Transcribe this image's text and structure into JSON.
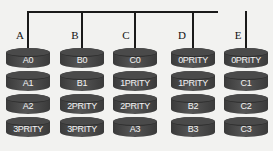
{
  "diagram": {
    "title": "",
    "bus": {
      "color": "#1a1a1a"
    },
    "disk_color": "#474747",
    "text_color": "#f4f4f4",
    "columns": [
      {
        "label": "A",
        "disks": [
          "A0",
          "A1",
          "A2",
          "3PRITY"
        ]
      },
      {
        "label": "B",
        "disks": [
          "B0",
          "B1",
          "2PRITY",
          "3PRITY"
        ]
      },
      {
        "label": "C",
        "disks": [
          "C0",
          "1PRITY",
          "2PRITY",
          "A3"
        ]
      },
      {
        "label": "D",
        "disks": [
          "0PRITY",
          "1PRITY",
          "B2",
          "B3"
        ]
      },
      {
        "label": "E",
        "disks": [
          "0PRITY",
          "C1",
          "C2",
          "C3"
        ]
      }
    ]
  }
}
